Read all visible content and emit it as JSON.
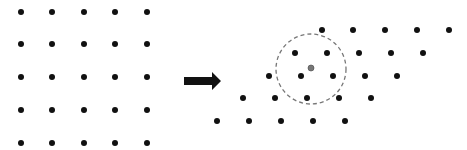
{
  "diagram": {
    "colors": {
      "dot": "#111111",
      "center_dot": "#777777",
      "circle": "#777777",
      "arrow": "#111111",
      "background": "#ffffff"
    },
    "left_lattice": {
      "xs": [
        21,
        52,
        84,
        115,
        147
      ],
      "ys": [
        12,
        44,
        77,
        110,
        143
      ],
      "dot_radius": 3
    },
    "arrow": {
      "x1": 184,
      "x2": 221,
      "y": 81,
      "shaft_half": 4,
      "head_half": 9,
      "head_len": 9
    },
    "right_lattice": {
      "rows": [
        {
          "y": 30,
          "xs": [
            322,
            353,
            385,
            417,
            449
          ]
        },
        {
          "y": 53,
          "xs": [
            295,
            327,
            359,
            391,
            423
          ]
        },
        {
          "y": 76,
          "xs": [
            269,
            301,
            333,
            365,
            397
          ]
        },
        {
          "y": 98,
          "xs": [
            243,
            275,
            307,
            339,
            371
          ]
        },
        {
          "y": 121,
          "xs": [
            217,
            249,
            281,
            313,
            345
          ]
        }
      ],
      "dot_radius": 3
    },
    "center_dot": {
      "x": 311,
      "y": 68,
      "r": 3
    },
    "neighborhood_circle": {
      "cx": 311,
      "cy": 69,
      "r": 35,
      "dash": "4 3"
    }
  }
}
